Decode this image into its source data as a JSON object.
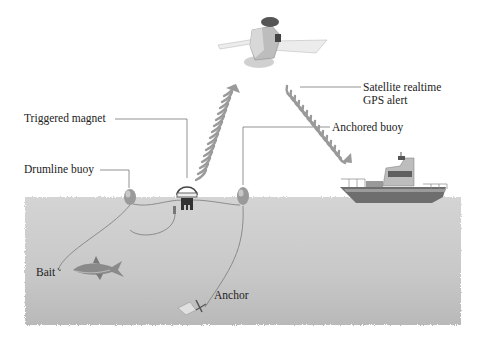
{
  "diagram": {
    "title": "",
    "labels": {
      "satellite_alert": [
        "Satellite realtime",
        "GPS alert"
      ],
      "anchored_buoy": "Anchored buoy",
      "triggered_magnet": "Triggered magnet",
      "drumline_buoy": "Drumline buoy",
      "bait": "Bait",
      "anchor": "Anchor"
    },
    "colors": {
      "water": "#c9c9c9",
      "water_dark": "#b8b8b8",
      "line": "#666666",
      "signal": "#9a9a9a",
      "text": "#222222"
    },
    "components": [
      "satellite",
      "signal-up",
      "signal-down",
      "boat",
      "drumline-buoy",
      "triggered-magnet",
      "anchored-buoy",
      "shark",
      "bait",
      "anchor"
    ]
  }
}
